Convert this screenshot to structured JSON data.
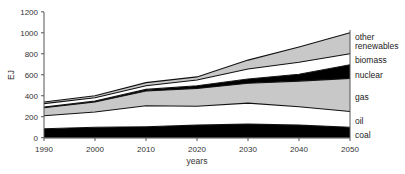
{
  "chart_data": {
    "type": "area",
    "stacked": true,
    "title": "",
    "xlabel": "years",
    "ylabel": "EJ",
    "xlim": [
      1990,
      2050
    ],
    "ylim": [
      0,
      1200
    ],
    "x": [
      1990,
      2000,
      2010,
      2020,
      2030,
      2040,
      2050
    ],
    "xticks": [
      1990,
      2000,
      2010,
      2020,
      2030,
      2040,
      2050
    ],
    "yticks": [
      0,
      200,
      400,
      600,
      800,
      1000,
      1200
    ],
    "grid": false,
    "legend_position": "right (inline labels at 2050)",
    "series": [
      {
        "name": "coal",
        "fill": "#000000",
        "values": [
          86,
          100,
          105,
          120,
          130,
          120,
          100
        ]
      },
      {
        "name": "oil",
        "fill": "#ffffff",
        "values": [
          124,
          145,
          200,
          180,
          200,
          175,
          150
        ]
      },
      {
        "name": "gas",
        "fill": "#c8c8c8",
        "values": [
          75,
          95,
          140,
          170,
          190,
          245,
          315
        ]
      },
      {
        "name": "nuclear",
        "fill": "#000000",
        "values": [
          8,
          10,
          15,
          25,
          40,
          65,
          130
        ]
      },
      {
        "name": "biomass",
        "fill": "#ffffff",
        "values": [
          32,
          30,
          35,
          55,
          95,
          115,
          105
        ]
      },
      {
        "name": "other renewables",
        "fill": "#c8c8c8",
        "values": [
          15,
          20,
          30,
          30,
          85,
          145,
          200
        ]
      }
    ],
    "cumulative_tops": {
      "coal": [
        86,
        100,
        105,
        120,
        130,
        120,
        100
      ],
      "oil": [
        210,
        245,
        305,
        300,
        330,
        295,
        250
      ],
      "gas": [
        285,
        340,
        445,
        470,
        520,
        540,
        565
      ],
      "nuclear": [
        293,
        350,
        460,
        495,
        560,
        605,
        695
      ],
      "biomass": [
        325,
        380,
        495,
        550,
        655,
        720,
        800
      ],
      "other renewables": [
        340,
        400,
        525,
        580,
        740,
        865,
        1000
      ]
    },
    "annotations": [
      "other",
      "renewables",
      "biomass",
      "nuclear",
      "gas",
      "oil",
      "coal"
    ]
  },
  "labels": {
    "ylabel": "EJ",
    "xlabel": "years",
    "yticks": [
      "0",
      "200",
      "400",
      "600",
      "800",
      "1000",
      "1200"
    ],
    "xticks": [
      "1990",
      "2000",
      "2010",
      "2020",
      "2030",
      "2040",
      "2050"
    ],
    "series": {
      "other_line1": "other",
      "other_line2": "renewables",
      "biomass": "biomass",
      "nuclear": "nuclear",
      "gas": "gas",
      "oil": "oil",
      "coal": "coal"
    }
  }
}
